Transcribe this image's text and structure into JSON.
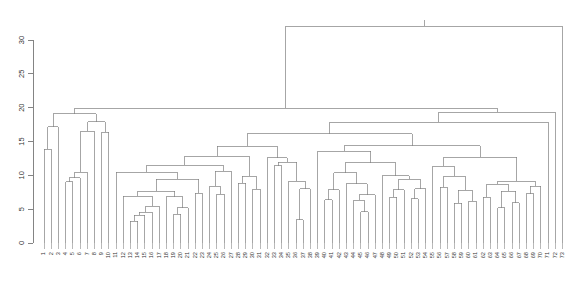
{
  "figure": {
    "kind": "dendrogram",
    "background": "#ffffff",
    "line_color": "#808080",
    "axis_color": "#777777",
    "text_color": "#333333"
  },
  "chart_data": {
    "type": "line",
    "subtype": "dendrogram",
    "title": "",
    "xlabel": "",
    "ylabel": "",
    "grid": false,
    "legend": null,
    "ylim": [
      0,
      33.5
    ],
    "yticks": [
      0,
      5,
      10,
      15,
      20,
      25,
      30
    ],
    "ytick_labels": [
      "0",
      "5",
      "10",
      "15",
      "20",
      "25",
      "30"
    ],
    "orientation": "top-down",
    "leaf_count": 73,
    "leaf_labels": [
      "1",
      "2",
      "3",
      "4",
      "5",
      "6",
      "7",
      "8",
      "9",
      "10",
      "11",
      "12",
      "13",
      "14",
      "15",
      "16",
      "17",
      "18",
      "19",
      "20",
      "21",
      "22",
      "23",
      "24",
      "25",
      "26",
      "27",
      "28",
      "29",
      "30",
      "31",
      "32",
      "33",
      "34",
      "35",
      "36",
      "37",
      "38",
      "39",
      "40",
      "41",
      "42",
      "43",
      "44",
      "45",
      "46",
      "47",
      "48",
      "49",
      "50",
      "51",
      "52",
      "53",
      "54",
      "55",
      "56",
      "57",
      "58",
      "59",
      "60",
      "61",
      "62",
      "63",
      "64",
      "65",
      "66",
      "67",
      "68",
      "69",
      "70",
      "71",
      "72",
      "73"
    ],
    "leaf_heights": [
      13.0,
      9.0,
      16.0,
      7.0,
      8.0,
      5.5,
      9.5,
      15.5,
      7.0,
      15.5,
      9.0,
      5.0,
      2.0,
      2.5,
      3.5,
      2.0,
      4.5,
      5.0,
      3.0,
      3.5,
      3.0,
      5.5,
      6.0,
      8.0,
      3.0,
      5.5,
      9.0,
      5.0,
      7.5,
      4.0,
      7.0,
      12.0,
      5.0,
      11.0,
      7.0,
      3.0,
      2.5,
      6.5,
      12.0,
      2.5,
      5.0,
      3.5,
      6.5,
      4.0,
      2.0,
      3.5,
      5.5,
      9.0,
      4.5,
      5.5,
      7.5,
      5.0,
      5.0,
      3.0,
      9.0,
      4.5,
      7.0,
      4.0,
      4.5,
      2.5,
      5.5,
      2.5,
      6.0,
      3.0,
      4.5,
      3.5,
      5.0,
      4.5,
      6.0,
      4.0,
      16.0,
      18.5,
      20.0
    ],
    "merges": [
      {
        "id": "m1",
        "height": 16.5,
        "left_leaf": 1,
        "right_leaf": 2,
        "note": "leaves 1-2"
      },
      {
        "id": "m2",
        "height": 18.5,
        "left_leaf": 4,
        "right_leaf": 5,
        "note": "leaves 4-5"
      },
      {
        "id": "m3",
        "height": 16.0,
        "left_leaf": 6,
        "right_leaf": 7,
        "note": "leaves 6-7"
      },
      {
        "id": "m4",
        "height": 30.2,
        "note": "left super-cluster root"
      },
      {
        "id": "m5",
        "height": 33.0,
        "note": "global root"
      },
      {
        "id": "m6",
        "height": 21.0,
        "note": "right super-cluster"
      },
      {
        "id": "m7",
        "height": 19.5,
        "note": "mid cluster A"
      },
      {
        "id": "m8",
        "height": 18.0,
        "note": "mid cluster B"
      },
      {
        "id": "m9",
        "height": 17.5,
        "note": "mid cluster C"
      },
      {
        "id": "m10",
        "height": 15.5,
        "note": "cluster of leaves 11-23"
      }
    ]
  },
  "axes": {
    "y_axis_name": "height",
    "x_axis_name": "observations"
  }
}
